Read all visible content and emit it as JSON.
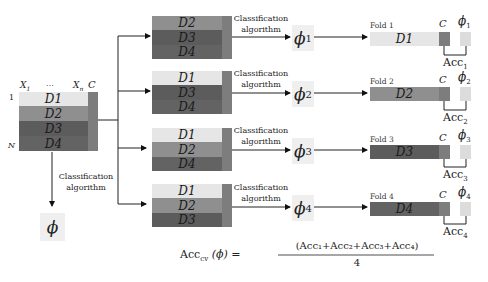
{
  "dataset": {
    "col_first": "X",
    "col_first_sub": "1",
    "col_dots": "…",
    "col_last": "X",
    "col_last_sub": "n",
    "class_col": "C",
    "row_first": "1",
    "row_last": "N",
    "blocks": [
      "D1",
      "D2",
      "D3",
      "D4"
    ]
  },
  "full_model": {
    "edge_label_line1": "Classification",
    "edge_label_line2": "algorithm",
    "phi": "ϕ"
  },
  "folds": [
    {
      "train_blocks": [
        "D2",
        "D3",
        "D4"
      ],
      "edge_label_line1": "Classification",
      "edge_label_line2": "algorithm",
      "phi": "ϕ",
      "phi_sub": "1",
      "fold_label": "Fold 1",
      "test_block": "D1",
      "class_col": "C",
      "acc": "Acc",
      "acc_sub": "1"
    },
    {
      "train_blocks": [
        "D1",
        "D3",
        "D4"
      ],
      "edge_label_line1": "Classification",
      "edge_label_line2": "algorithm",
      "phi": "ϕ",
      "phi_sub": "2",
      "fold_label": "Fold 2",
      "test_block": "D2",
      "class_col": "C",
      "acc": "Acc",
      "acc_sub": "2"
    },
    {
      "train_blocks": [
        "D1",
        "D2",
        "D4"
      ],
      "edge_label_line1": "Classification",
      "edge_label_line2": "algorithm",
      "phi": "ϕ",
      "phi_sub": "3",
      "fold_label": "Fold 3",
      "test_block": "D3",
      "class_col": "C",
      "acc": "Acc",
      "acc_sub": "3"
    },
    {
      "train_blocks": [
        "D1",
        "D2",
        "D3"
      ],
      "edge_label_line1": "Classification",
      "edge_label_line2": "algorithm",
      "phi": "ϕ",
      "phi_sub": "4",
      "fold_label": "Fold 4",
      "test_block": "D4",
      "class_col": "C",
      "acc": "Acc",
      "acc_sub": "4"
    }
  ],
  "formula": {
    "lhs": "Acc",
    "lhs_sub": "cv",
    "lhs_arg": "(ϕ) =",
    "numerator": "(Acc₁+Acc₂+Acc₃+Acc₄)",
    "denominator": "4"
  },
  "colors": {
    "D1": "#e6e6e6",
    "D2": "#8f8f8f",
    "D3": "#5c5c5c",
    "D4": "#636363",
    "class_col": "#7d7d7d",
    "phi_box": "#efefef"
  }
}
